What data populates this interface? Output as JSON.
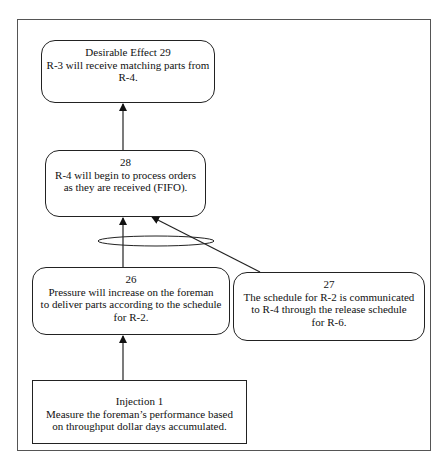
{
  "diagram": {
    "type": "cause-effect-tree",
    "colors": {
      "stroke": "#222222",
      "frame": "#555555",
      "background": "#ffffff"
    },
    "nodes": {
      "de29": {
        "id": "29",
        "shape": "rounded-rect",
        "lines": [
          "Desirable Effect 29",
          "R-3 will receive matching parts from",
          "R-4."
        ]
      },
      "e28": {
        "id": "28",
        "shape": "rounded-rect",
        "lines": [
          "28",
          "R-4 will begin to process orders",
          "as they are received (FIFO)."
        ]
      },
      "e26": {
        "id": "26",
        "shape": "rounded-rect",
        "lines": [
          "26",
          "Pressure will increase on the foreman",
          "to deliver parts according to the schedule",
          "for R-2."
        ]
      },
      "e27": {
        "id": "27",
        "shape": "rounded-rect",
        "lines": [
          "27",
          "The schedule for R-2 is communicated",
          "to R-4 through the release schedule",
          "for R-6."
        ]
      },
      "inj1": {
        "id": "Injection 1",
        "shape": "rect",
        "lines": [
          "Injection 1",
          "Measure the foreman’s performance based",
          "on throughput dollar days accumulated."
        ]
      }
    },
    "edges": [
      {
        "from": "inj1",
        "to": "e26"
      },
      {
        "from": "e26",
        "to": "e28",
        "and_group": "g1"
      },
      {
        "from": "e27",
        "to": "e28",
        "and_group": "g1"
      },
      {
        "from": "e28",
        "to": "de29"
      }
    ],
    "and_connector": {
      "group": "g1",
      "shape": "ellipse"
    }
  }
}
